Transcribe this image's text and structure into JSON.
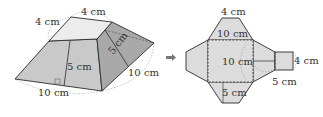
{
  "colors": {
    "stroke": "#2b2b2b",
    "top_face": "#ececec",
    "front_face": "#c9c9c9",
    "side_face": "#a9a9a9",
    "net_fill": "#dcdcdc",
    "dashed": "#555555",
    "arrow": "#777777"
  },
  "solid": {
    "labels": {
      "top_edge_back": "4 cm",
      "top_edge_left": "4 cm",
      "slant_height_side": "5 cm",
      "slant_height_front": "5 cm",
      "base_edge_right": "10 cm",
      "base_edge_front": "10 cm"
    }
  },
  "arrow": {
    "symbol": "➡"
  },
  "net": {
    "labels": {
      "top_small_edge": "4 cm",
      "top_trapezoid_base": "10 cm",
      "square_side": "10 cm",
      "right_small_edge": "4 cm",
      "right_slant": "5 cm",
      "bottom_slant": "5 cm"
    }
  }
}
